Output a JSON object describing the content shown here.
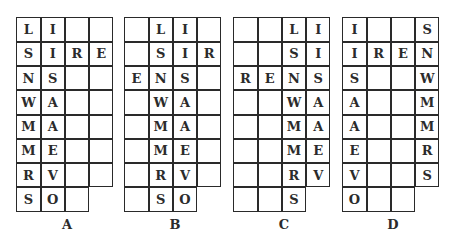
{
  "puzzles": [
    {
      "label": "A",
      "rows": [
        [
          "L",
          "I",
          "",
          ""
        ],
        [
          "S",
          "I",
          "R",
          "E"
        ],
        [
          "N",
          "S",
          "",
          ""
        ],
        [
          "W",
          "A",
          "",
          ""
        ],
        [
          "M",
          "A",
          "",
          ""
        ],
        [
          "M",
          "E",
          "",
          ""
        ],
        [
          "R",
          "V",
          "",
          ""
        ],
        [
          "S",
          "O",
          "",
          null
        ]
      ]
    },
    {
      "label": "B",
      "rows": [
        [
          "",
          "L",
          "I",
          ""
        ],
        [
          "",
          "S",
          "I",
          "R"
        ],
        [
          "E",
          "N",
          "S",
          ""
        ],
        [
          "",
          "W",
          "A",
          ""
        ],
        [
          "",
          "M",
          "A",
          ""
        ],
        [
          "",
          "M",
          "E",
          ""
        ],
        [
          "",
          "R",
          "V",
          ""
        ],
        [
          "",
          "S",
          "O",
          null
        ]
      ]
    },
    {
      "label": "C",
      "rows": [
        [
          "",
          "",
          "L",
          "I"
        ],
        [
          "",
          "",
          "S",
          "I"
        ],
        [
          "R",
          "E",
          "N",
          "S"
        ],
        [
          "",
          "",
          "W",
          "A"
        ],
        [
          "",
          "",
          "M",
          "A"
        ],
        [
          "",
          "",
          "M",
          "E"
        ],
        [
          "",
          "",
          "R",
          "V"
        ],
        [
          "",
          "",
          "S",
          null
        ]
      ]
    },
    {
      "label": "D",
      "rows": [
        [
          "I",
          "",
          "",
          "S"
        ],
        [
          "I",
          "R",
          "E",
          "N"
        ],
        [
          "S",
          "",
          "",
          "W"
        ],
        [
          "A",
          "",
          "",
          "M"
        ],
        [
          "A",
          "",
          "",
          "M"
        ],
        [
          "E",
          "",
          "",
          "R"
        ],
        [
          "V",
          "",
          "",
          "S"
        ],
        [
          "O",
          "",
          "",
          null
        ]
      ]
    }
  ]
}
